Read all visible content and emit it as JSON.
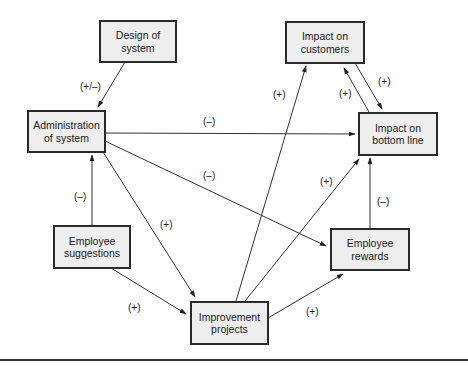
{
  "nodes": {
    "design": "Design of\nsystem",
    "admin": "Administration\nof system",
    "customers": "Impact on\ncustomers",
    "bottom": "Impact on\nbottom line",
    "suggestions": "Employee\nsuggestions",
    "projects": "Improvement\nprojects",
    "rewards": "Employee\nrewards"
  },
  "edges": [
    {
      "from": "Design of system",
      "to": "Administration of system",
      "label": "(+/–)"
    },
    {
      "from": "Administration of system",
      "to": "Impact on bottom line",
      "label": "(–)"
    },
    {
      "from": "Administration of system",
      "to": "Employee rewards",
      "label": "(–)"
    },
    {
      "from": "Administration of system",
      "to": "Improvement projects",
      "label": "(+)"
    },
    {
      "from": "Employee suggestions",
      "to": "Administration of system",
      "label": "(–)"
    },
    {
      "from": "Employee suggestions",
      "to": "Improvement projects",
      "label": "(+)"
    },
    {
      "from": "Improvement projects",
      "to": "Impact on customers",
      "label": "(+)"
    },
    {
      "from": "Improvement projects",
      "to": "Impact on bottom line",
      "label": "(+)"
    },
    {
      "from": "Improvement projects",
      "to": "Employee rewards",
      "label": "(+)"
    },
    {
      "from": "Employee rewards",
      "to": "Impact on bottom line",
      "label": "(–)"
    },
    {
      "from": "Impact on customers",
      "to": "Impact on bottom line",
      "label": "(+)"
    },
    {
      "from": "Impact on bottom line",
      "to": "Impact on customers",
      "label": "(+)"
    }
  ],
  "labels": {
    "design_admin": "(+/–)",
    "admin_bottom": "(–)",
    "admin_rewards": "(–)",
    "admin_projects": "(+)",
    "sugg_admin": "(–)",
    "sugg_projects": "(+)",
    "proj_customers": "(+)",
    "proj_bottom": "(+)",
    "proj_rewards": "(+)",
    "rewards_bottom": "(–)",
    "cust_bottom": "(+)",
    "bottom_cust": "(+)"
  }
}
